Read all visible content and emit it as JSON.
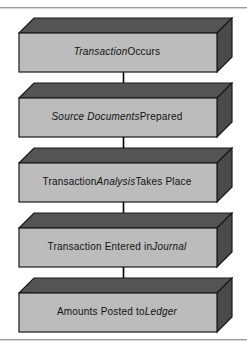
{
  "figure": {
    "background_color": "#ffffff",
    "rule_color": "#9a9a9a",
    "box_front_color": "#bcbcbc",
    "box_top_color": "#545454",
    "box_side_color": "#4a4a4a",
    "box_outline_color": "#1a1a1a",
    "arrow_color": "#000000",
    "text_color": "#111111"
  },
  "nodes": [
    {
      "id": "transaction-occurs",
      "parts": [
        {
          "text": "Transaction",
          "style": "italic"
        },
        {
          "text": " Occurs",
          "style": "regular"
        }
      ],
      "full_text": "Transaction Occurs"
    },
    {
      "id": "source-documents-prepared",
      "parts": [
        {
          "text": "Source Documents",
          "style": "italic"
        },
        {
          "text": " Prepared",
          "style": "regular"
        }
      ],
      "full_text": "Source Documents Prepared"
    },
    {
      "id": "transaction-analysis-takes-place",
      "parts": [
        {
          "text": "Transaction ",
          "style": "regular"
        },
        {
          "text": "Analysis",
          "style": "italic"
        },
        {
          "text": " Takes Place",
          "style": "regular"
        }
      ],
      "full_text": "Transaction Analysis Takes Place"
    },
    {
      "id": "transaction-entered-in-journal",
      "parts": [
        {
          "text": "Transaction Entered in ",
          "style": "regular"
        },
        {
          "text": "Journal",
          "style": "italic"
        }
      ],
      "full_text": "Transaction Entered in Journal"
    },
    {
      "id": "amounts-posted-to-ledger",
      "parts": [
        {
          "text": "Amounts Posted to ",
          "style": "regular"
        },
        {
          "text": "Ledger",
          "style": "italic"
        }
      ],
      "full_text": "Amounts Posted to Ledger"
    }
  ],
  "connectors": [
    {
      "id": "arrow-1",
      "from": "transaction-occurs",
      "to": "source-documents-prepared"
    },
    {
      "id": "arrow-2",
      "from": "source-documents-prepared",
      "to": "transaction-analysis-takes-place"
    },
    {
      "id": "arrow-3",
      "from": "transaction-analysis-takes-place",
      "to": "transaction-entered-in-journal"
    },
    {
      "id": "arrow-4",
      "from": "transaction-entered-in-journal",
      "to": "amounts-posted-to-ledger"
    }
  ]
}
